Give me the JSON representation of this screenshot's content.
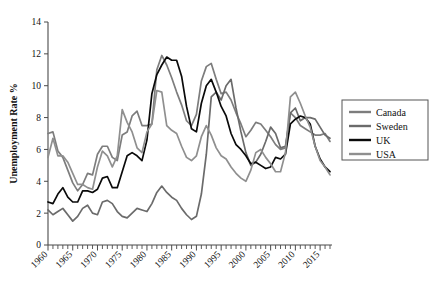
{
  "chart_data": {
    "type": "line",
    "title": "",
    "xlabel": "",
    "ylabel": "Unemployment Rate %",
    "xlim": [
      1960,
      2017
    ],
    "ylim": [
      0,
      14
    ],
    "ytick_step": 2,
    "xtick_label_step": 5,
    "xtick_minor_step": 1,
    "grid": false,
    "legend_position": "right",
    "yticks": [
      "0",
      "2",
      "4",
      "6",
      "8",
      "10",
      "12",
      "14"
    ],
    "xticks": [
      "1960",
      "1965",
      "1970",
      "1975",
      "1980",
      "1985",
      "1990",
      "1995",
      "2000",
      "2005",
      "2010",
      "2015"
    ],
    "x": [
      1960,
      1961,
      1962,
      1963,
      1964,
      1965,
      1966,
      1967,
      1968,
      1969,
      1970,
      1971,
      1972,
      1973,
      1974,
      1975,
      1976,
      1977,
      1978,
      1979,
      1980,
      1981,
      1982,
      1983,
      1984,
      1985,
      1986,
      1987,
      1988,
      1989,
      1990,
      1991,
      1992,
      1993,
      1994,
      1995,
      1996,
      1997,
      1998,
      1999,
      2000,
      2001,
      2002,
      2003,
      2004,
      2005,
      2006,
      2007,
      2008,
      2009,
      2010,
      2011,
      2012,
      2013,
      2014,
      2015,
      2016,
      2017
    ],
    "series": [
      {
        "name": "Canada",
        "color": "#7d7d7d",
        "values": [
          7.0,
          7.1,
          5.9,
          5.5,
          4.7,
          3.9,
          3.4,
          3.8,
          4.5,
          4.4,
          5.7,
          6.2,
          6.2,
          5.5,
          5.3,
          6.9,
          7.1,
          8.1,
          8.4,
          7.5,
          7.5,
          7.6,
          11.0,
          11.9,
          11.3,
          10.5,
          9.6,
          8.8,
          7.8,
          7.5,
          8.2,
          10.3,
          11.2,
          11.4,
          10.4,
          9.5,
          9.6,
          9.1,
          8.3,
          7.6,
          6.8,
          7.2,
          7.7,
          7.6,
          7.2,
          6.8,
          6.3,
          6.0,
          6.1,
          8.3,
          8.0,
          7.5,
          7.3,
          7.1,
          6.9,
          6.9,
          7.0,
          6.5
        ]
      },
      {
        "name": "Sweden",
        "color": "#6b6b6b",
        "values": [
          2.2,
          1.9,
          2.1,
          2.3,
          1.9,
          1.5,
          1.8,
          2.3,
          2.5,
          2.0,
          1.9,
          2.7,
          2.8,
          2.6,
          2.1,
          1.8,
          1.7,
          2.0,
          2.3,
          2.2,
          2.1,
          2.6,
          3.3,
          3.7,
          3.3,
          3.0,
          2.8,
          2.3,
          1.9,
          1.6,
          1.8,
          3.2,
          5.7,
          9.3,
          9.6,
          9.1,
          10.0,
          10.4,
          8.6,
          7.1,
          5.8,
          5.0,
          5.2,
          5.7,
          6.5,
          7.4,
          7.0,
          6.1,
          6.2,
          8.3,
          8.6,
          7.8,
          8.0,
          8.0,
          7.9,
          7.4,
          6.9,
          6.7
        ]
      },
      {
        "name": "UK",
        "color": "#0a0a0a",
        "values": [
          2.7,
          2.6,
          3.2,
          3.6,
          3.0,
          2.7,
          2.7,
          3.4,
          3.4,
          3.3,
          3.5,
          4.2,
          4.3,
          3.6,
          3.6,
          4.6,
          5.6,
          5.8,
          5.6,
          5.3,
          6.6,
          9.5,
          10.7,
          11.3,
          11.8,
          11.6,
          11.6,
          10.6,
          8.7,
          7.3,
          7.1,
          8.9,
          10.0,
          10.4,
          9.6,
          8.7,
          8.1,
          7.0,
          6.3,
          6.0,
          5.6,
          5.1,
          5.2,
          5.0,
          4.8,
          4.9,
          5.5,
          5.4,
          5.7,
          7.6,
          7.9,
          8.1,
          8.0,
          7.6,
          6.2,
          5.4,
          4.9,
          4.6
        ]
      },
      {
        "name": "USA",
        "color": "#8f8f8f",
        "values": [
          5.5,
          6.7,
          5.6,
          5.6,
          5.2,
          4.5,
          3.8,
          3.8,
          3.6,
          3.5,
          4.9,
          5.9,
          5.6,
          4.9,
          5.6,
          8.5,
          7.7,
          7.1,
          6.1,
          5.8,
          7.1,
          7.6,
          9.7,
          9.6,
          7.5,
          7.2,
          7.0,
          6.2,
          5.5,
          5.3,
          5.6,
          6.8,
          7.5,
          6.9,
          6.1,
          5.6,
          5.4,
          4.9,
          4.5,
          4.2,
          4.0,
          4.7,
          5.8,
          6.0,
          5.5,
          5.1,
          4.6,
          4.6,
          5.8,
          9.3,
          9.6,
          8.9,
          8.1,
          7.4,
          6.2,
          5.3,
          4.9,
          4.4
        ]
      }
    ]
  },
  "legend": {
    "items": [
      {
        "label": "Canada",
        "color": "#7d7d7d"
      },
      {
        "label": "Sweden",
        "color": "#6b6b6b"
      },
      {
        "label": "UK",
        "color": "#0a0a0a"
      },
      {
        "label": "USA",
        "color": "#8f8f8f"
      }
    ]
  }
}
